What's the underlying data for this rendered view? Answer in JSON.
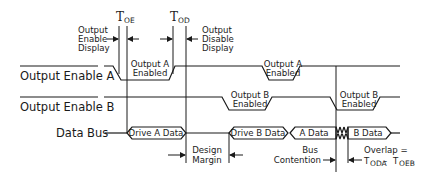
{
  "diagram": {
    "timing_labels": {
      "t_oe": {
        "main": "T",
        "sub": "OE"
      },
      "t_od": {
        "main": "T",
        "sub": "OD"
      }
    },
    "annotations": {
      "output_enable_display": [
        "Output",
        "Enable",
        "Display"
      ],
      "output_disable_display": [
        "Output",
        "Disable",
        "Display"
      ],
      "design_margin": [
        "Design",
        "Margin"
      ],
      "bus_contention": [
        "Bus",
        "Contention"
      ],
      "overlap": {
        "line1": "Overlap =",
        "t1_main": "T",
        "t1_sub": "ODA",
        "minus": " - ",
        "t2_main": "T",
        "t2_sub": "OEB"
      }
    },
    "signals": [
      {
        "name": "Output Enable A",
        "overbar": true
      },
      {
        "name": "Output Enable B",
        "overbar": true
      },
      {
        "name": "Data Bus",
        "overbar": false
      }
    ],
    "pulse_labels": {
      "oea_1": [
        "Output A",
        "Enabled"
      ],
      "oea_2": [
        "Output A",
        "Enabled"
      ],
      "oeb_1": [
        "Output B",
        "Enabled"
      ],
      "oeb_2": [
        "Output B",
        "Enabled"
      ]
    },
    "bus_segments": {
      "drive_a": "Drive A Data",
      "drive_b": "Drive B Data",
      "a_data": "A Data",
      "b_data": "B Data"
    },
    "colors": {
      "ink": "#1a1a1a",
      "background": "#ffffff"
    }
  }
}
